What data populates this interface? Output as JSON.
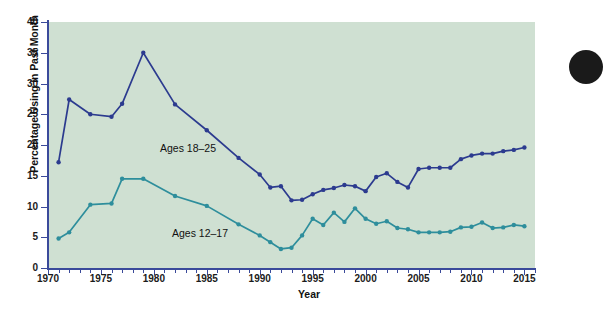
{
  "chart_data": {
    "type": "line",
    "title": "",
    "xlabel": "Year",
    "ylabel": "Percentage Using in Past Month",
    "xlim": [
      1970,
      2016
    ],
    "ylim": [
      0,
      40
    ],
    "yticks": [
      0,
      5,
      10,
      15,
      20,
      25,
      30,
      35,
      40
    ],
    "xticks": [
      1970,
      1975,
      1980,
      1985,
      1990,
      1995,
      2000,
      2005,
      2010,
      2015
    ],
    "xtick_labels": [
      "1970",
      "1975",
      "1980",
      "1985",
      "1990",
      "1995",
      "2000",
      "2005",
      "2010",
      "2015"
    ],
    "ytick_labels": [
      "0",
      "5",
      "10",
      "15",
      "20",
      "25",
      "30",
      "35",
      "40"
    ],
    "grid": false,
    "legend_position": "inline-annotation",
    "plot_background": "#cfe0d2",
    "series": [
      {
        "name": "Ages 18–25",
        "color": "#2c3b8f",
        "marker": "circle",
        "x": [
          1971,
          1972,
          1974,
          1976,
          1977,
          1979,
          1982,
          1985,
          1988,
          1990,
          1991,
          1992,
          1993,
          1994,
          1995,
          1996,
          1997,
          1998,
          1999,
          2000,
          2001,
          2002,
          2003,
          2004,
          2005,
          2006,
          2007,
          2008,
          2009,
          2010,
          2011,
          2012,
          2013,
          2014,
          2015
        ],
        "values": [
          17.2,
          27.4,
          25.0,
          24.6,
          26.7,
          35.0,
          26.6,
          22.4,
          17.9,
          15.2,
          13.1,
          13.3,
          11.0,
          11.1,
          12.0,
          12.7,
          13.0,
          13.5,
          13.3,
          12.5,
          14.8,
          15.4,
          14.0,
          13.1,
          16.1,
          16.3,
          16.3,
          16.3,
          17.7,
          18.3,
          18.6,
          18.6,
          19.0,
          19.2,
          19.6
        ]
      },
      {
        "name": "Ages 12–17",
        "color": "#2e8e9c",
        "marker": "circle",
        "x": [
          1971,
          1972,
          1974,
          1976,
          1977,
          1979,
          1982,
          1985,
          1988,
          1990,
          1991,
          1992,
          1993,
          1994,
          1995,
          1996,
          1997,
          1998,
          1999,
          2000,
          2001,
          2002,
          2003,
          2004,
          2005,
          2006,
          2007,
          2008,
          2009,
          2010,
          2011,
          2012,
          2013,
          2014,
          2015
        ],
        "values": [
          4.8,
          5.8,
          10.3,
          10.5,
          14.5,
          14.5,
          11.7,
          10.1,
          7.1,
          5.3,
          4.2,
          3.1,
          3.3,
          5.3,
          8.0,
          7.0,
          9.0,
          7.5,
          9.7,
          8.0,
          7.2,
          7.6,
          6.5,
          6.3,
          5.8,
          5.8,
          5.8,
          5.9,
          6.6,
          6.7,
          7.4,
          6.5,
          6.6,
          7.0,
          6.8
        ]
      }
    ],
    "annotations": [
      {
        "text": "Ages 18–25",
        "x": 1980.5,
        "y": 18.5
      },
      {
        "text": "Ages 12–17",
        "x": 1981.5,
        "y": 5.6
      }
    ]
  }
}
